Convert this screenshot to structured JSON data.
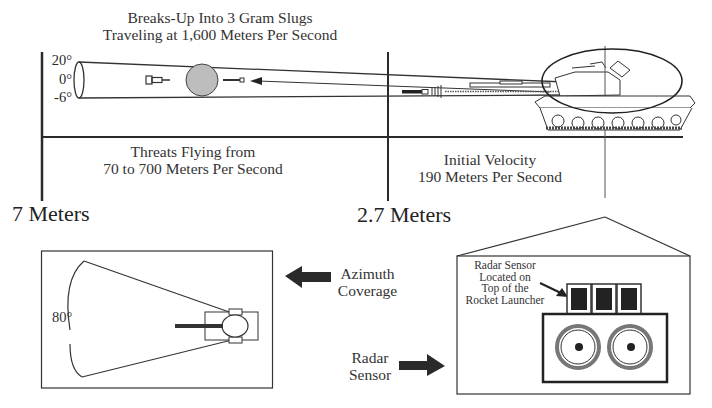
{
  "diagram": {
    "top_title": [
      "Breaks-Up Into 3 Gram Slugs",
      "Traveling at 1,600 Meters Per Second"
    ],
    "elevation_ticks": [
      "20°",
      "0°",
      "-6°"
    ],
    "threats_label": [
      "Threats Flying from",
      "70 to 700 Meters Per Second"
    ],
    "initial_velocity_label": [
      "Initial Velocity",
      "190 Meters Per Second"
    ],
    "distance_far": "7 Meters",
    "distance_near": "2.7 Meters",
    "azimuth_angle": "80°",
    "azimuth_label": [
      "Azimuth",
      "Coverage"
    ],
    "radar_label": [
      "Radar",
      "Sensor"
    ],
    "radar_detail_label": [
      "Radar Sensor",
      "Located on",
      "Top of the",
      "Rocket Launcher"
    ],
    "icons": [
      "missile-icon",
      "interceptor-fragment-cloud-icon",
      "projectile-icon",
      "tank-icon",
      "rocket-launcher-icon",
      "radar-sensor-icon",
      "arrow-left-icon",
      "arrow-right-icon"
    ],
    "colors": {
      "line": "#2a2a2a",
      "fragment_cloud": "#bdbdbd",
      "sensor_fill": "#222222",
      "launcher_ring": "#777777"
    }
  }
}
